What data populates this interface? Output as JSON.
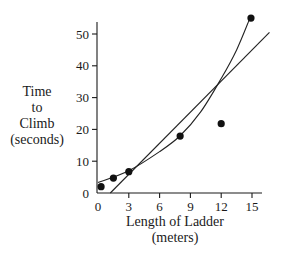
{
  "chart_data": {
    "type": "scatter",
    "title": "",
    "xlabel": "Length of Ladder (meters)",
    "xlabel_lines": [
      "Length of Ladder",
      "(meters)"
    ],
    "ylabel": "Time to Climb (seconds)",
    "ylabel_lines": [
      "Time",
      "to",
      "Climb",
      "(seconds)"
    ],
    "xlim": [
      0,
      16.7
    ],
    "ylim": [
      0,
      53
    ],
    "xticks": [
      0,
      3,
      6,
      9,
      12,
      15
    ],
    "yticks": [
      0,
      10,
      20,
      30,
      40,
      50
    ],
    "grid": false,
    "legend": null,
    "series": [
      {
        "name": "observations",
        "kind": "scatter",
        "x": [
          0.3,
          1.5,
          3.0,
          8.0,
          12.0,
          14.9
        ],
        "y": [
          2.0,
          4.7,
          6.7,
          17.9,
          21.8,
          55.0
        ]
      },
      {
        "name": "linear fit",
        "kind": "line",
        "x": [
          1.2,
          16.7
        ],
        "y": [
          0,
          50.5
        ]
      },
      {
        "name": "curved fit",
        "kind": "curve",
        "x": [
          0,
          3,
          6,
          8,
          10,
          12,
          13.5,
          14.8
        ],
        "y": [
          3.3,
          7.0,
          13.0,
          18.0,
          25.5,
          36.0,
          45.0,
          55.0
        ]
      }
    ]
  }
}
